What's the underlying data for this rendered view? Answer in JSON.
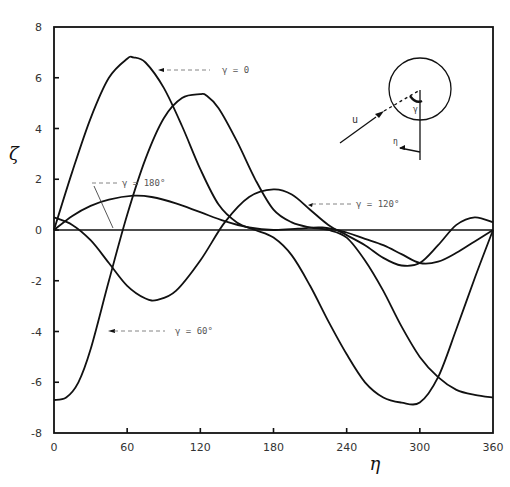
{
  "chart_data": {
    "type": "line",
    "title": "",
    "xlabel": "η",
    "ylabel": "ζ",
    "xlim": [
      0,
      360
    ],
    "ylim": [
      -8,
      8
    ],
    "xticks": [
      0,
      60,
      120,
      180,
      240,
      300,
      360
    ],
    "yticks": [
      -8,
      -6,
      -4,
      -2,
      0,
      2,
      4,
      6,
      8
    ],
    "xtick_labels": [
      "0",
      "60",
      "120",
      "180",
      "240",
      "300",
      "360"
    ],
    "ytick_labels": [
      "-8",
      "-6",
      "-4",
      "-2",
      "0",
      "2",
      "4",
      "6",
      "8"
    ],
    "grid": false,
    "zero_line": true,
    "series": [
      {
        "name": "γ = 0",
        "label": "γ = 0",
        "x": [
          0,
          15,
          30,
          45,
          60,
          65,
          75,
          90,
          105,
          120,
          135,
          150,
          165,
          180,
          195,
          210,
          225,
          240,
          255,
          270,
          285,
          300,
          315,
          330,
          345,
          360
        ],
        "y": [
          0,
          2.3,
          4.4,
          6.0,
          6.75,
          6.8,
          6.6,
          5.6,
          4.1,
          2.4,
          1.0,
          0.3,
          0.0,
          -0.3,
          -1.0,
          -2.2,
          -3.6,
          -4.9,
          -6.0,
          -6.6,
          -6.8,
          -6.8,
          -5.8,
          -3.9,
          -1.9,
          0
        ]
      },
      {
        "name": "γ = 60°",
        "label": "γ = 60°",
        "x": [
          0,
          10,
          20,
          30,
          45,
          60,
          75,
          90,
          105,
          120,
          125,
          135,
          150,
          165,
          180,
          195,
          210,
          225,
          240,
          255,
          270,
          285,
          300,
          315,
          330,
          345,
          360
        ],
        "y": [
          -6.7,
          -6.6,
          -6.0,
          -4.7,
          -2.0,
          0.6,
          2.8,
          4.4,
          5.2,
          5.35,
          5.3,
          4.8,
          3.5,
          2.0,
          0.8,
          0.3,
          0.1,
          0.0,
          -0.3,
          -1.2,
          -2.4,
          -3.8,
          -5.0,
          -5.8,
          -6.3,
          -6.5,
          -6.6
        ]
      },
      {
        "name": "γ = 120°",
        "label": "γ = 120°",
        "x": [
          0,
          15,
          30,
          45,
          60,
          75,
          85,
          100,
          120,
          140,
          160,
          180,
          195,
          210,
          225,
          240,
          255,
          270,
          285,
          300,
          315,
          330,
          345,
          360
        ],
        "y": [
          0.5,
          0.2,
          -0.4,
          -1.3,
          -2.2,
          -2.7,
          -2.75,
          -2.4,
          -1.2,
          0.3,
          1.3,
          1.6,
          1.4,
          0.8,
          0.2,
          -0.2,
          -0.6,
          -1.1,
          -1.4,
          -1.3,
          -0.6,
          0.2,
          0.5,
          0.3
        ]
      },
      {
        "name": "γ = 180°",
        "label": "γ = 180°",
        "x": [
          0,
          15,
          30,
          45,
          65,
          80,
          100,
          120,
          140,
          160,
          180,
          200,
          220,
          240,
          255,
          270,
          285,
          300,
          315,
          330,
          345,
          360
        ],
        "y": [
          0,
          0.55,
          0.95,
          1.2,
          1.35,
          1.3,
          1.05,
          0.7,
          0.35,
          0.1,
          0.0,
          0.05,
          0.1,
          -0.1,
          -0.35,
          -0.6,
          -0.95,
          -1.3,
          -1.25,
          -0.9,
          -0.45,
          0
        ]
      }
    ],
    "annotations": [
      {
        "text": "γ = 0",
        "x_px": 175,
        "y_px": 77,
        "points_to": "γ = 0 curve near η≈85"
      },
      {
        "text": "γ = 180°",
        "x_px": 95,
        "y_px": 182,
        "points_to": "γ = 180° curve near η≈70"
      },
      {
        "text": "γ = 120°",
        "x_px": 348,
        "y_px": 205,
        "points_to": "γ = 120° curve near η≈210"
      },
      {
        "text": "γ = 60°",
        "x_px": 122,
        "y_px": 330,
        "points_to": "γ = 60° curve near η≈25"
      }
    ],
    "inset": {
      "description": "circle with incoming wave arrow u at angle γ, and η direction arrow",
      "labels": [
        "u",
        "γ",
        "η"
      ]
    }
  },
  "labels": {
    "xlabel": "η",
    "ylabel": "ζ",
    "ann_g0": "γ = 0",
    "ann_g180": "γ = 180°",
    "ann_g120": "γ = 120°",
    "ann_g60": "γ = 60°",
    "inset_u": "u",
    "inset_gamma": "γ",
    "inset_eta": "η"
  }
}
